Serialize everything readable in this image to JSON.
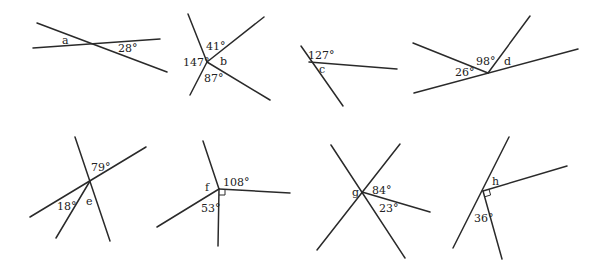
{
  "figures": [
    {
      "id": "a",
      "labels": {
        "unknown": "a",
        "angle1": "28°"
      },
      "lines": [
        [
          37,
          23,
          167,
          72
        ],
        [
          33,
          48,
          160,
          39
        ]
      ],
      "label_pos": {
        "unknown": [
          62,
          44
        ],
        "angle1": [
          118,
          52
        ]
      }
    },
    {
      "id": "b",
      "labels": {
        "unknown": "b",
        "angle1": "41°",
        "angle2": "147°",
        "angle3": "87°"
      },
      "lines": [
        [
          207,
          62,
          188,
          14
        ],
        [
          207,
          62,
          264,
          17
        ],
        [
          207,
          62,
          270,
          100
        ],
        [
          207,
          62,
          190,
          95
        ]
      ],
      "label_pos": {
        "unknown": [
          220,
          65
        ],
        "angle1": [
          206,
          50
        ],
        "angle2": [
          183,
          66
        ],
        "angle3": [
          204,
          82
        ]
      }
    },
    {
      "id": "c",
      "labels": {
        "unknown": "c",
        "angle1": "127°"
      },
      "lines": [
        [
          301,
          46,
          343,
          106
        ],
        [
          309,
          62,
          397,
          69
        ]
      ],
      "label_pos": {
        "unknown": [
          319,
          73
        ],
        "angle1": [
          308,
          59
        ]
      }
    },
    {
      "id": "d",
      "labels": {
        "unknown": "d",
        "angle1": "98°",
        "angle2": "26°"
      },
      "lines": [
        [
          414,
          93,
          578,
          49
        ],
        [
          413,
          43,
          488,
          73
        ],
        [
          488,
          73,
          530,
          16
        ]
      ],
      "label_pos": {
        "unknown": [
          504,
          65
        ],
        "angle1": [
          476,
          65
        ],
        "angle2": [
          455,
          76
        ]
      }
    },
    {
      "id": "e",
      "labels": {
        "unknown": "e",
        "angle1": "79°",
        "angle2": "18°"
      },
      "lines": [
        [
          75,
          137,
          110,
          241
        ],
        [
          30,
          217,
          146,
          147
        ],
        [
          90,
          181,
          56,
          238
        ]
      ],
      "label_pos": {
        "unknown": [
          86,
          205
        ],
        "angle1": [
          91,
          171
        ],
        "angle2": [
          57,
          210
        ]
      }
    },
    {
      "id": "f",
      "labels": {
        "unknown": "f",
        "angle1": "108°",
        "angle2": "53°"
      },
      "lines": [
        [
          219,
          189,
          203,
          141
        ],
        [
          219,
          189,
          290,
          193
        ],
        [
          219,
          189,
          218,
          246
        ],
        [
          219,
          189,
          157,
          227
        ]
      ],
      "label_pos": {
        "unknown": [
          205,
          191
        ],
        "angle1": [
          223,
          186
        ],
        "angle2": [
          201,
          212
        ]
      },
      "right_angle": [
        219,
        189
      ]
    },
    {
      "id": "g",
      "labels": {
        "unknown": "g",
        "angle1": "84°",
        "angle2": "23°"
      },
      "lines": [
        [
          331,
          145,
          405,
          258
        ],
        [
          317,
          250,
          400,
          144
        ],
        [
          362,
          192,
          430,
          212
        ]
      ],
      "label_pos": {
        "unknown": [
          352,
          196
        ],
        "angle1": [
          372,
          194
        ],
        "angle2": [
          379,
          212
        ]
      }
    },
    {
      "id": "h",
      "labels": {
        "unknown": "h",
        "angle1": "36°"
      },
      "lines": [
        [
          453,
          248,
          509,
          137
        ],
        [
          483,
          191,
          567,
          166
        ],
        [
          483,
          191,
          502,
          259
        ]
      ],
      "label_pos": {
        "unknown": [
          492,
          185
        ],
        "angle1": [
          474,
          222
        ]
      },
      "right_angle": [
        483,
        191
      ]
    }
  ]
}
